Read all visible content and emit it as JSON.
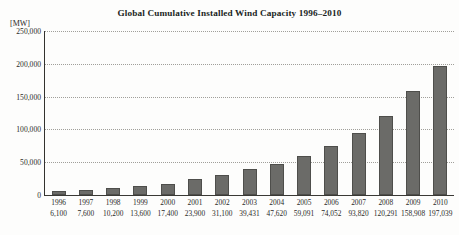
{
  "chart_data": {
    "type": "bar",
    "title": "Global Cumulative Installed Wind Capacity 1996–2010",
    "xlabel": "",
    "ylabel": "[MW]",
    "unit": "[MW]",
    "categories": [
      "1996",
      "1997",
      "1998",
      "1999",
      "2000",
      "2001",
      "2002",
      "2003",
      "2004",
      "2005",
      "2006",
      "2007",
      "2008",
      "2009",
      "2010"
    ],
    "values": [
      6100,
      7600,
      10200,
      13600,
      17400,
      23900,
      31100,
      39431,
      47620,
      59091,
      74052,
      93820,
      120291,
      158908,
      197039
    ],
    "value_labels": [
      "6,100",
      "7,600",
      "10,200",
      "13,600",
      "17,400",
      "23,900",
      "31,100",
      "39,431",
      "47,620",
      "59,091",
      "74,052",
      "93,820",
      "120,291",
      "158,908",
      "197,039"
    ],
    "ylim": [
      0,
      250000
    ],
    "ytick_values": [
      0,
      50000,
      100000,
      150000,
      200000,
      250000
    ],
    "ytick_labels": [
      "0",
      "50,000",
      "100,000",
      "150,000",
      "200,000",
      "250,000"
    ],
    "grid": true,
    "grid_style": "dotted",
    "legend": false,
    "bar_color": "#6b6b68",
    "grid_color": "#9c9a95",
    "axis_color": "#33322e",
    "text_color": "#2b2a28",
    "background_color": "#fdfdfc"
  }
}
